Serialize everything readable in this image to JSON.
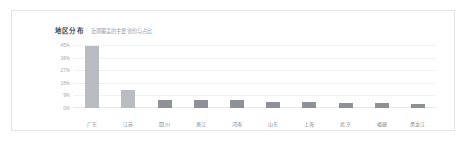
{
  "card": {
    "title": "地区分布",
    "subtitle": "近期覆盖的主要省份与占比"
  },
  "chart_data": {
    "type": "bar",
    "title": "地区分布",
    "subtitle": "近期覆盖的主要省份与占比",
    "xlabel": "",
    "ylabel": "",
    "categories": [
      "广东",
      "江苏",
      "四川",
      "浙江",
      "河南",
      "山东",
      "上海",
      "北京",
      "福建",
      "黑龙江"
    ],
    "values": [
      44,
      13,
      6,
      6,
      5.5,
      4.5,
      4.5,
      3.5,
      3.5,
      3
    ],
    "value_suffix": "%",
    "ylim": [
      0,
      45
    ],
    "yticks": [
      45,
      36,
      27,
      18,
      9,
      0
    ],
    "ytick_labels": [
      "45%",
      "36%",
      "27%",
      "18%",
      "9%",
      "0%"
    ],
    "grid": true,
    "legend": false,
    "bar_colors": [
      "#b9bcc0",
      "#b9bcc0",
      "#8e9298",
      "#8e9298",
      "#8e9298",
      "#8e9298",
      "#8e9298",
      "#8e9298",
      "#8e9298",
      "#8e9298"
    ],
    "colors": {
      "bar_light": "#b9bcc0",
      "bar_dark": "#8e9298",
      "grid": "#f0f1f3",
      "axis": "#e6e8ea",
      "tick_text": "#a2a8b2",
      "label_text": "#7f858f",
      "title_text": "#3d4450",
      "subtitle_text": "#9aa0ab",
      "card_border": "#e2e4e7",
      "card_background": "#ffffff"
    }
  }
}
